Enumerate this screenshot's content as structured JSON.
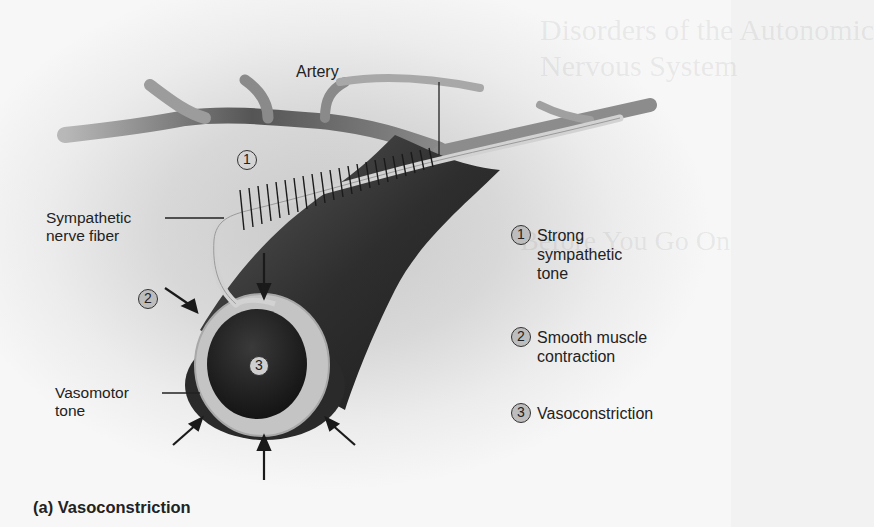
{
  "figure": {
    "caption": "(a) Vasoconstriction",
    "labels": {
      "artery": "Artery",
      "nerve_line1": "Sympathetic",
      "nerve_line2": "nerve fiber",
      "vasomotor_line1": "Vasomotor",
      "vasomotor_line2": "tone"
    },
    "markers": [
      {
        "num": "1"
      },
      {
        "num": "2"
      },
      {
        "num": "3"
      }
    ],
    "legend": [
      {
        "num": "1",
        "lines": [
          "Strong",
          "sympathetic",
          "tone"
        ]
      },
      {
        "num": "2",
        "lines": [
          "Smooth muscle",
          "contraction"
        ]
      },
      {
        "num": "3",
        "lines": [
          "Vasoconstriction"
        ]
      }
    ]
  },
  "bleed_through": {
    "title_line1": "Disorders of the Autonomic",
    "title_line2": "Nervous System",
    "heading": "Before You Go On"
  }
}
